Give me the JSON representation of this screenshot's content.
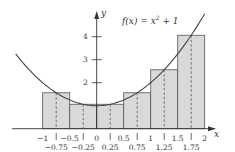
{
  "chart_data": {
    "type": "bar",
    "title": "",
    "annotation": "f(x) = x² + 1",
    "xlabel": "x",
    "ylabel": "y",
    "xlim": [
      -1.6,
      2.15
    ],
    "ylim": [
      0,
      5
    ],
    "grid": false,
    "x_ticks": [
      "-1",
      "-0.5",
      "0",
      "0.5",
      "1",
      "1.5",
      "2"
    ],
    "midpoint_labels": [
      "-0.75",
      "-0.25",
      "0.25",
      "0.75",
      "1.25",
      "1.75"
    ],
    "y_ticks": [
      "2",
      "3",
      "4"
    ],
    "bars": {
      "left_edges": [
        -1,
        -0.5,
        0,
        0.5,
        1,
        1.5
      ],
      "width": 0.5,
      "midpoints": [
        -0.75,
        -0.25,
        0.25,
        0.75,
        1.25,
        1.75
      ],
      "heights": [
        1.5625,
        1.0625,
        1.0625,
        1.5625,
        2.5625,
        4.0625
      ]
    },
    "curve": {
      "name": "f(x) = x^2 + 1",
      "x_range": [
        -1.5,
        2.0
      ]
    },
    "colors": {
      "bar_fill": "#d9d9d9",
      "bar_stroke": "#555555",
      "curve": "#444444",
      "axis": "#333333"
    }
  },
  "labels": {
    "equation_prefix": "f(x) = x",
    "equation_exp": "2",
    "equation_suffix": " + 1",
    "x_axis": "x",
    "y_axis": "y"
  }
}
